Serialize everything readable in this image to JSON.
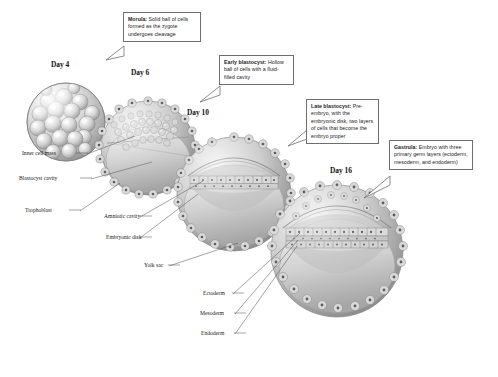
{
  "figure": {
    "background_color": "#ffffff",
    "line_color": "#6e6e6e"
  },
  "callouts": [
    {
      "id": "morula",
      "term": "Morula:",
      "text": " Solid ball of cells formed as the zygote undergoes cleavage"
    },
    {
      "id": "early-blastocyst",
      "term": "Early blastocyst:",
      "text": " Hollow ball of cells with a fluid-filled cavity"
    },
    {
      "id": "late-blastocyst",
      "term": "Late blastocyst:",
      "text": " Pre-embryo, with the embryonic disk, two layers of cells that become the embryo proper"
    },
    {
      "id": "gastrula",
      "term": "Gastrula:",
      "text": " Embryo with three primary germ layers (ectoderm, mesoderm, and endoderm)"
    }
  ],
  "stages": [
    {
      "id": "day-4",
      "day_label": "Day 4"
    },
    {
      "id": "day-6",
      "day_label": "Day 6"
    },
    {
      "id": "day-10",
      "day_label": "Day 10"
    },
    {
      "id": "day-16",
      "day_label": "Day 16"
    }
  ],
  "annotations": [
    {
      "id": "inner-cell-mass",
      "label": "Inner cell mass"
    },
    {
      "id": "blastocyst-cavity",
      "label": "Blastocyst cavity"
    },
    {
      "id": "trophoblast",
      "label": "Trophoblast"
    },
    {
      "id": "amniotic-cavity",
      "label": "Amniotic cavity"
    },
    {
      "id": "embryonic-disk",
      "label": "Embryonic disk"
    },
    {
      "id": "yolk-sac",
      "label": "Yolk sac"
    },
    {
      "id": "ectoderm",
      "label": "Ectoderm"
    },
    {
      "id": "mesoderm",
      "label": "Mesoderm"
    },
    {
      "id": "endoderm",
      "label": "Endoderm"
    }
  ]
}
